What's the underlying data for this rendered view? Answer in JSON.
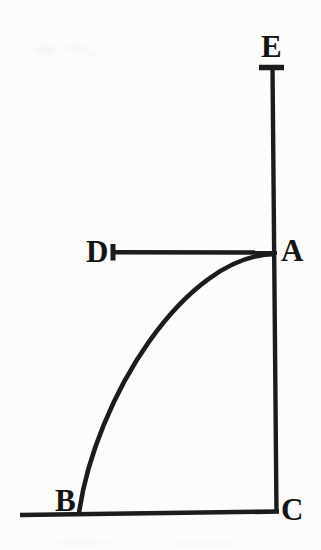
{
  "figure": {
    "background_color": "#fcfcfb",
    "line_color": "#1c1c1c",
    "text_color": "#141414",
    "labels": {
      "E": "E",
      "D": "D",
      "A": "A",
      "B": "B",
      "C": "C"
    }
  }
}
